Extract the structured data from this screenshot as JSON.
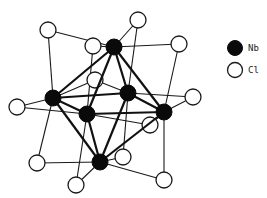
{
  "figure": {
    "colors": {
      "nb": "#0a0a0a",
      "cl": "#ffffff",
      "bond": "#111111"
    }
  },
  "legend": {
    "items": [
      {
        "symbol": "filled-circle",
        "label": "Nb"
      },
      {
        "symbol": "open-circle",
        "label": "Cl"
      }
    ]
  },
  "atoms": {
    "nb": [
      {
        "id": "top",
        "x": 114,
        "y": 47
      },
      {
        "id": "left",
        "x": 53,
        "y": 98
      },
      {
        "id": "front",
        "x": 87,
        "y": 114
      },
      {
        "id": "back",
        "x": 128,
        "y": 93
      },
      {
        "id": "right",
        "x": 164,
        "y": 112
      },
      {
        "id": "bottom",
        "x": 100,
        "y": 162
      }
    ],
    "cl": [
      {
        "x": 48,
        "y": 30,
        "bridges": [
          "top",
          "left"
        ]
      },
      {
        "x": 93,
        "y": 46,
        "bridges": [
          "top",
          "front"
        ]
      },
      {
        "x": 138,
        "y": 20,
        "bridges": [
          "top",
          "back"
        ]
      },
      {
        "x": 179,
        "y": 44,
        "bridges": [
          "top",
          "right"
        ]
      },
      {
        "x": 17,
        "y": 107,
        "bridges": [
          "left",
          "front"
        ]
      },
      {
        "x": 95,
        "y": 80,
        "bridges": [
          "left",
          "back"
        ]
      },
      {
        "x": 193,
        "y": 97,
        "bridges": [
          "back",
          "right"
        ]
      },
      {
        "x": 150,
        "y": 125,
        "bridges": [
          "front",
          "right"
        ]
      },
      {
        "x": 37,
        "y": 163,
        "bridges": [
          "left",
          "bottom"
        ]
      },
      {
        "x": 76,
        "y": 185,
        "bridges": [
          "front",
          "bottom"
        ]
      },
      {
        "x": 123,
        "y": 157,
        "bridges": [
          "back",
          "bottom"
        ]
      },
      {
        "x": 164,
        "y": 180,
        "bridges": [
          "right",
          "bottom"
        ]
      }
    ]
  }
}
